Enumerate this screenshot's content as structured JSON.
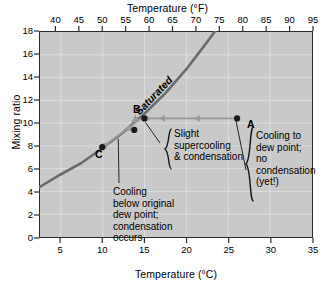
{
  "figure": {
    "top_axis_title": "Temperature (°F)",
    "bottom_axis_title": "Temperature (°C)",
    "left_axis_title": "Mixing ratio",
    "curve_label": "Saturated",
    "background_color": "#c9c9c9",
    "grid_color": "#dddddd",
    "curve_color": "#6b6b6b",
    "arrow_color": "#9a9a9a",
    "point_color": "#1a1a1a",
    "frame_color": "#2b2b2b"
  },
  "annotations": {
    "a_label": "A",
    "b_label": "B",
    "c_label": "C",
    "note_supercooling": "Slight\nsupercooling\n& condensation",
    "note_cooling_dewpoint": "Cooling to\ndew point;\nno\ncondensation\n(yet!)",
    "note_below_dewpoint": "Cooling\nbelow original\ndew point;\ncondensation\noccurs"
  },
  "chart_data": {
    "type": "line",
    "title": "",
    "xlabel": "Temperature (°C)",
    "ylabel": "Mixing ratio",
    "xlim": [
      2.5,
      35
    ],
    "ylim": [
      0,
      18
    ],
    "grid": true,
    "legend": "none",
    "x_ticks_c": [
      5,
      10,
      15,
      20,
      25,
      30,
      35
    ],
    "x_ticks_f": [
      35,
      40,
      45,
      50,
      55,
      60,
      65,
      70,
      75,
      80,
      85,
      90,
      95
    ],
    "y_ticks": [
      0,
      2,
      4,
      6,
      8,
      10,
      12,
      14,
      16,
      18
    ],
    "secondary_xlabel": "Temperature (°F)",
    "series": [
      {
        "name": "Saturated",
        "type": "line",
        "x": [
          2.5,
          5,
          7.5,
          10,
          12.5,
          15,
          17.5,
          20,
          22.5,
          24.0
        ],
        "y": [
          4.4,
          5.5,
          6.5,
          7.8,
          9.2,
          10.8,
          12.6,
          14.7,
          17.1,
          18.6
        ]
      }
    ],
    "points": [
      {
        "label": "A",
        "x": 26.0,
        "y": 10.4
      },
      {
        "label": "B",
        "x": 15.0,
        "y": 10.4
      },
      {
        "label": "",
        "x": 13.8,
        "y": 9.4
      },
      {
        "label": "C",
        "x": 10.0,
        "y": 7.9
      }
    ],
    "process_arrows": [
      {
        "from_x": 26.0,
        "to_x": 15.0,
        "y": 10.4,
        "direction": "left"
      },
      {
        "from_x": 15.0,
        "to_x": 10.0,
        "from_y": 10.4,
        "to_y": 7.9,
        "direction": "down-left"
      }
    ]
  }
}
